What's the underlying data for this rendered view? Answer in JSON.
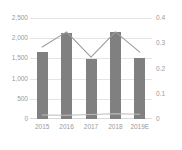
{
  "chart_data": {
    "type": "bar",
    "title": "",
    "subtitle": "",
    "xlabel": "",
    "ylabel": "",
    "categories": [
      "2015",
      "2016",
      "2017",
      "2018",
      "2019E"
    ],
    "grid": true,
    "legend": "none",
    "axes": {
      "left": {
        "min": 0,
        "max": 2500,
        "tick_step": 500,
        "ticks": [
          0,
          500,
          1000,
          1500,
          2000,
          2500
        ],
        "tick_labels": [
          "0",
          "500",
          "1,000",
          "1,500",
          "2,000",
          "2,500"
        ]
      },
      "right": {
        "min": 0,
        "max": 0.4,
        "tick_step": 0.1,
        "ticks": [
          0,
          0.1,
          0.2,
          0.3,
          0.4
        ],
        "tick_labels": [
          "0",
          "0.1",
          "0.2",
          "0.3",
          "0.4"
        ]
      }
    },
    "series": [
      {
        "name": "bars",
        "render": "bar",
        "axis": "left",
        "color": "#808080",
        "values": [
          1670,
          2130,
          1490,
          2150,
          1500
        ]
      },
      {
        "name": "line-upper",
        "render": "line",
        "axis": "right",
        "color": "#9c9c9c",
        "values": [
          0.285,
          0.345,
          0.245,
          0.345,
          0.265
        ]
      },
      {
        "name": "line-lower",
        "render": "line",
        "axis": "right",
        "color": "#bdbdbd",
        "values": [
          0.016,
          0.015,
          0.018,
          0.021,
          0.019
        ]
      }
    ]
  },
  "colors": {
    "bar": "#808080",
    "line_upper": "#9c9c9c",
    "line_lower": "#bdbdbd",
    "gridline": "#e4e4e4",
    "tick_text": "#9a9a9a",
    "background": "#ffffff"
  }
}
